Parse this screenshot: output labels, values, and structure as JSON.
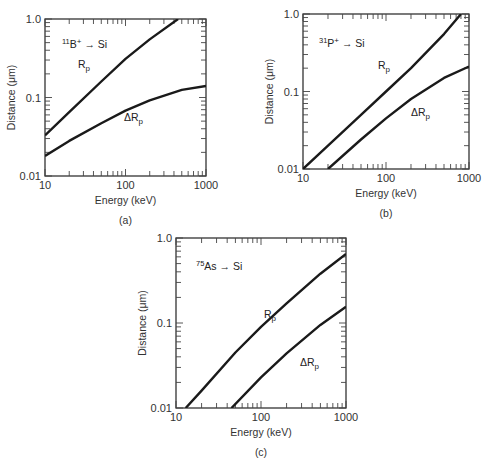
{
  "chart_data": [
    {
      "id": "a",
      "type": "line",
      "caption": "(a)",
      "annotation": {
        "isotope": "11",
        "species": "B",
        "charge": "+",
        "arrow": "→",
        "target": "Si"
      },
      "xlabel": "Energy (keV)",
      "ylabel": "Distance (μm)",
      "xscale": "log",
      "yscale": "log",
      "xlim": [
        10,
        1000
      ],
      "ylim": [
        0.01,
        1.0
      ],
      "xticks": [
        "10",
        "100",
        "1000"
      ],
      "yticks": [
        "0.01",
        "0.1",
        "1.0"
      ],
      "grid": false,
      "legend": "inline labels",
      "box": {
        "x0": 45,
        "x1": 206,
        "y0": 19,
        "y1": 176
      },
      "series": [
        {
          "name": "Rp",
          "label_main": "R",
          "label_sub": "p",
          "label_pos": [
            78,
            68
          ],
          "x": [
            10,
            20,
            50,
            100,
            200,
            450
          ],
          "y": [
            0.033,
            0.065,
            0.16,
            0.31,
            0.55,
            1.0
          ]
        },
        {
          "name": "ΔRp",
          "label_main": "ΔR",
          "label_sub": "p",
          "label_pos": [
            124,
            121
          ],
          "x": [
            10,
            20,
            50,
            100,
            200,
            500,
            1000
          ],
          "y": [
            0.018,
            0.028,
            0.047,
            0.068,
            0.092,
            0.125,
            0.14
          ]
        }
      ],
      "annotation_pos": [
        62,
        48
      ]
    },
    {
      "id": "b",
      "type": "line",
      "caption": "(b)",
      "annotation": {
        "isotope": "31",
        "species": "P",
        "charge": "+",
        "arrow": "→",
        "target": "Si"
      },
      "xlabel": "Energy (keV)",
      "ylabel": "Distance (μm)",
      "xscale": "log",
      "yscale": "log",
      "xlim": [
        10,
        1000
      ],
      "ylim": [
        0.01,
        1.0
      ],
      "xticks": [
        "10",
        "100",
        "1000"
      ],
      "yticks": [
        "0.01",
        "0.1",
        "1.0"
      ],
      "grid": false,
      "legend": "inline labels",
      "box": {
        "x0": 303,
        "x1": 469,
        "y0": 14,
        "y1": 169
      },
      "series": [
        {
          "name": "Rp",
          "label_main": "R",
          "label_sub": "p",
          "label_pos": [
            378,
            69
          ],
          "x": [
            10,
            20,
            50,
            100,
            200,
            500,
            800
          ],
          "y": [
            0.01,
            0.02,
            0.05,
            0.1,
            0.2,
            0.55,
            1.0
          ]
        },
        {
          "name": "ΔRp",
          "label_main": "ΔR",
          "label_sub": "p",
          "label_pos": [
            411,
            116
          ],
          "x": [
            20,
            50,
            100,
            200,
            500,
            1000
          ],
          "y": [
            0.01,
            0.024,
            0.045,
            0.08,
            0.15,
            0.21
          ]
        }
      ],
      "annotation_pos": [
        319,
        47
      ]
    },
    {
      "id": "c",
      "type": "line",
      "caption": "(c)",
      "annotation": {
        "isotope": "75",
        "species": "As",
        "charge": "",
        "arrow": "→",
        "target": "Si"
      },
      "xlabel": "Energy (keV)",
      "ylabel": "Distance (μm)",
      "xscale": "log",
      "yscale": "log",
      "xlim": [
        10,
        1000
      ],
      "ylim": [
        0.01,
        1.0
      ],
      "xticks": [
        "10",
        "100",
        "1000"
      ],
      "yticks": [
        "0.01",
        "0.1",
        "1.0"
      ],
      "grid": false,
      "legend": "inline labels",
      "box": {
        "x0": 176,
        "x1": 346,
        "y0": 238,
        "y1": 408
      },
      "series": [
        {
          "name": "Rp",
          "label_main": "R",
          "label_sub": "p",
          "label_pos": [
            264,
            318
          ],
          "x": [
            13,
            20,
            50,
            100,
            200,
            500,
            1000
          ],
          "y": [
            0.01,
            0.016,
            0.045,
            0.09,
            0.17,
            0.38,
            0.65
          ]
        },
        {
          "name": "ΔRp",
          "label_main": "ΔR",
          "label_sub": "p",
          "label_pos": [
            300,
            366
          ],
          "x": [
            45,
            100,
            200,
            500,
            1000
          ],
          "y": [
            0.01,
            0.023,
            0.044,
            0.095,
            0.155
          ]
        }
      ],
      "annotation_pos": [
        196,
        270
      ]
    }
  ]
}
